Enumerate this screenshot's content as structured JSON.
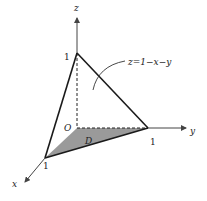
{
  "diagram": {
    "axes": {
      "x_label": "x",
      "y_label": "y",
      "z_label": "z",
      "origin_label": "O"
    },
    "ticks": {
      "x_one": "1",
      "y_one": "1",
      "z_one": "1"
    },
    "region_label": "D",
    "surface_label": "z=1−x−y",
    "colors": {
      "line": "#1a1a1a",
      "axis": "#444444",
      "region_fill": "#999999"
    }
  }
}
